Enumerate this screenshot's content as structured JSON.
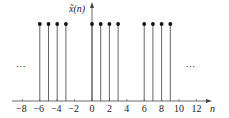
{
  "chart_data": {
    "type": "stem",
    "title": "",
    "ylabel": "x̃(n)",
    "xlabel": "n",
    "x": [
      -6,
      -5,
      -4,
      -3,
      0,
      1,
      2,
      3,
      6,
      7,
      8,
      9
    ],
    "values": [
      1,
      1,
      1,
      1,
      1,
      1,
      1,
      1,
      1,
      1,
      1,
      1
    ],
    "xticks": [
      -8,
      -6,
      -4,
      -2,
      0,
      2,
      4,
      6,
      8,
      10,
      12
    ],
    "xtick_labels": [
      "−8",
      "−6",
      "−4",
      "−2",
      "0",
      "2",
      "4",
      "6",
      "8",
      "10",
      "12"
    ],
    "xlim": [
      -9,
      13.5
    ],
    "ylim": [
      0,
      1.2
    ],
    "grid": false,
    "legend": null,
    "annotations": [
      {
        "text": "···",
        "position": "left",
        "x": -8.3
      },
      {
        "text": "···",
        "position": "right",
        "x": 11.2
      }
    ],
    "period": 6,
    "style": {
      "stem_color": "#555555",
      "marker_color": "#111111",
      "axis_color": "#444444"
    }
  }
}
